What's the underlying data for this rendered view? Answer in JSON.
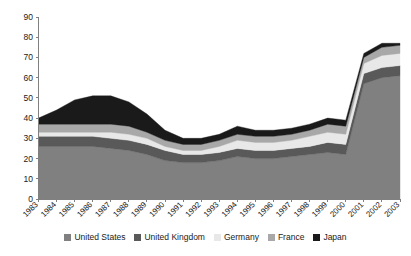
{
  "chart_data": {
    "type": "area",
    "stacked": true,
    "title": "",
    "subtitle": "",
    "xlabel": "",
    "ylabel": "",
    "ylim": [
      0,
      90
    ],
    "ytick_step": 10,
    "yticks": [
      0,
      10,
      20,
      30,
      40,
      50,
      60,
      70,
      80,
      90
    ],
    "grid": false,
    "legend_position": "bottom",
    "categories": [
      "1983",
      "1984",
      "1985",
      "1986",
      "1987",
      "1988",
      "1989",
      "1990",
      "1991",
      "1992",
      "1993",
      "1994",
      "1995",
      "1996",
      "1997",
      "1998",
      "1999",
      "2000",
      "2001",
      "2002",
      "2003"
    ],
    "series": [
      {
        "name": "United States",
        "color": "#808080",
        "values": [
          26,
          26,
          26,
          26,
          25,
          24,
          22,
          19,
          18,
          18,
          19,
          21,
          20,
          20,
          21,
          22,
          23,
          22,
          57,
          60,
          61
        ]
      },
      {
        "name": "United Kingdom",
        "color": "#595959",
        "values": [
          5,
          5,
          5,
          5,
          5,
          5,
          5,
          5,
          4,
          4,
          4,
          4,
          4,
          4,
          4,
          4,
          5,
          5,
          5,
          5,
          5
        ]
      },
      {
        "name": "Germany",
        "color": "#e8e8e8",
        "values": [
          2,
          2,
          2,
          2,
          3,
          3,
          3,
          2,
          2,
          2,
          3,
          4,
          4,
          4,
          4,
          5,
          5,
          5,
          5,
          6,
          6
        ]
      },
      {
        "name": "France",
        "color": "#a8a8a8",
        "values": [
          4,
          4,
          4,
          4,
          4,
          4,
          3,
          3,
          3,
          3,
          3,
          3,
          3,
          3,
          3,
          3,
          4,
          4,
          3,
          4,
          4
        ]
      },
      {
        "name": "Japan",
        "color": "#1a1a1a",
        "values": [
          3,
          7,
          12,
          14,
          14,
          12,
          9,
          5,
          3,
          3,
          3,
          4,
          3,
          3,
          3,
          3,
          3,
          3,
          2,
          2,
          1
        ]
      }
    ],
    "totals": [
      40,
      44,
      49,
      51,
      51,
      48,
      42,
      34,
      30,
      30,
      32,
      36,
      34,
      34,
      35,
      37,
      40,
      39,
      72,
      77,
      77
    ]
  },
  "legend": {
    "items": [
      {
        "label": "United States"
      },
      {
        "label": "United Kingdom"
      },
      {
        "label": "Germany"
      },
      {
        "label": "France"
      },
      {
        "label": "Japan"
      }
    ]
  },
  "axes": {
    "y_labels": [
      "90",
      "80",
      "70",
      "60",
      "50",
      "40",
      "30",
      "20",
      "10",
      "0"
    ],
    "x_labels": [
      "1983",
      "1984",
      "1985",
      "1986",
      "1987",
      "1988",
      "1989",
      "1990",
      "1991",
      "1992",
      "1993",
      "1994",
      "1995",
      "1996",
      "1997",
      "1998",
      "1999",
      "2000",
      "2001",
      "2002",
      "2003"
    ]
  }
}
